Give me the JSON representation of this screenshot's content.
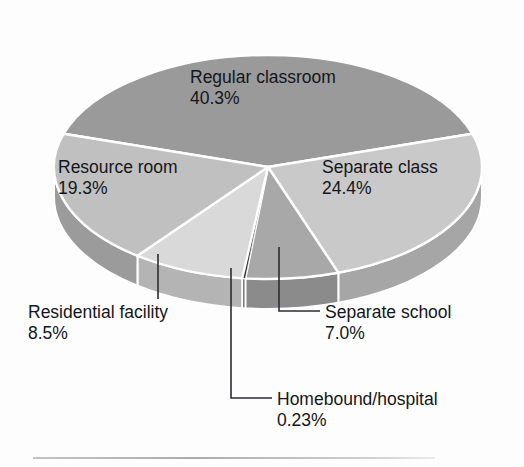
{
  "chart_data": {
    "type": "pie",
    "title": "",
    "subtitle": "",
    "xlabel": "",
    "ylabel": "",
    "legend_position": "none",
    "grid": false,
    "categories": [
      "Regular classroom",
      "Separate class",
      "Separate school",
      "Homebound/hospital",
      "Residential facility",
      "Resource room"
    ],
    "values": [
      40.3,
      24.4,
      7.0,
      0.23,
      8.5,
      19.3
    ],
    "value_labels": [
      "40.3%",
      "24.4%",
      "7.0%",
      "0.23%",
      "8.5%",
      "19.3%"
    ],
    "units": "percent",
    "slices": [
      {
        "name": "Regular classroom",
        "value": 40.3,
        "value_label": "40.3%",
        "color": "#9a9a9a",
        "side_color": "#7e7e7e",
        "label_placement": "inside",
        "label_line1": "Regular classroom",
        "label_line2": "40.3%"
      },
      {
        "name": "Separate class",
        "value": 24.4,
        "value_label": "24.4%",
        "color": "#c9c9c9",
        "side_color": "#a6a6a6",
        "label_placement": "inside",
        "label_line1": "Separate class",
        "label_line2": "24.4%"
      },
      {
        "name": "Separate school",
        "value": 7.0,
        "value_label": "7.0%",
        "color": "#a8a8a8",
        "side_color": "#8b8b8b",
        "label_placement": "callout",
        "label_line1": "Separate school",
        "label_line2": "7.0%"
      },
      {
        "name": "Homebound/hospital",
        "value": 0.23,
        "value_label": "0.23%",
        "color": "#2b2b2b",
        "side_color": "#1a1a1a",
        "label_placement": "callout",
        "label_line1": "Homebound/hospital",
        "label_line2": "0.23%"
      },
      {
        "name": "Residential facility",
        "value": 8.5,
        "value_label": "8.5%",
        "color": "#d9d9d9",
        "side_color": "#b4b4b4",
        "label_placement": "callout",
        "label_line1": "Residential facility",
        "label_line2": "8.5%"
      },
      {
        "name": "Resource room",
        "value": 19.3,
        "value_label": "19.3%",
        "color": "#c0c0c0",
        "side_color": "#9b9b9b",
        "label_placement": "inside",
        "label_line1": "Resource room",
        "label_line2": "19.3%"
      }
    ],
    "colors": {
      "background": "#fdfdfd",
      "separator": "#ffffff",
      "text": "#14161a",
      "leader_line": "#2a2d31",
      "shadow": "#d2d2d2"
    }
  },
  "labels": {
    "regular_classroom": {
      "name": "Regular classroom",
      "pct": "40.3%"
    },
    "resource_room": {
      "name": "Resource room",
      "pct": "19.3%"
    },
    "separate_class": {
      "name": "Separate class",
      "pct": "24.4%"
    },
    "residential_facility": {
      "name": "Residential facility",
      "pct": "8.5%"
    },
    "separate_school": {
      "name": "Separate school",
      "pct": "7.0%"
    },
    "homebound_hospital": {
      "name": "Homebound/hospital",
      "pct": "0.23%"
    }
  }
}
